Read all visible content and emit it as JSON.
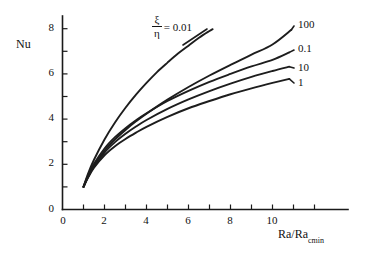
{
  "chart_data": {
    "type": "line",
    "title": "",
    "xlabel": "Ra/Ra",
    "xlabel_sub": "cmin",
    "ylabel": "Nu",
    "xlim": [
      0,
      12.6
    ],
    "ylim": [
      0,
      9.0
    ],
    "xticks": [
      0,
      1,
      2,
      3,
      4,
      5,
      6,
      7,
      8,
      9,
      10,
      11,
      12
    ],
    "xtick_labels": [
      "0",
      "",
      "2",
      "",
      "4",
      "",
      "6",
      "",
      "8",
      "",
      "10",
      "",
      ""
    ],
    "yticks": [
      0,
      1,
      2,
      3,
      4,
      5,
      6,
      7,
      8
    ],
    "ytick_labels": [
      "0",
      "",
      "2",
      "",
      "4",
      "",
      "6",
      "",
      "8"
    ],
    "grid": false,
    "legend_position": "inline-curve-end-labels",
    "parameter_symbol": "ξ/η",
    "parameter_numerator": "ξ",
    "parameter_denominator": "η",
    "annotation": "ξ/η = 0.01",
    "annotation_equals": "= 0.01",
    "series": [
      {
        "name": "0.01",
        "label": "0.01",
        "x": [
          1.0,
          1.2,
          1.5,
          2.0,
          2.5,
          3.0,
          3.5,
          4.0,
          4.5,
          5.0,
          5.5,
          6.0,
          6.5,
          7.0,
          7.15
        ],
        "y": [
          1.0,
          1.55,
          2.2,
          3.1,
          3.85,
          4.5,
          5.08,
          5.6,
          6.08,
          6.5,
          6.9,
          7.25,
          7.6,
          7.9,
          7.98
        ]
      },
      {
        "name": "100",
        "label": "100",
        "x": [
          1.0,
          1.2,
          1.5,
          2.0,
          2.5,
          3.0,
          3.5,
          4.0,
          5.0,
          6.0,
          7.0,
          8.0,
          9.0,
          10.0,
          10.9
        ],
        "y": [
          1.0,
          1.42,
          1.95,
          2.6,
          3.1,
          3.52,
          3.9,
          4.24,
          4.86,
          5.42,
          5.93,
          6.4,
          6.85,
          7.3,
          7.95
        ]
      },
      {
        "name": "0.1",
        "label": "0.1",
        "x": [
          1.0,
          1.2,
          1.5,
          2.0,
          2.5,
          3.0,
          3.5,
          4.0,
          5.0,
          6.0,
          7.0,
          8.0,
          9.0,
          10.0,
          10.8
        ],
        "y": [
          1.0,
          1.48,
          2.02,
          2.7,
          3.2,
          3.6,
          3.95,
          4.26,
          4.8,
          5.25,
          5.65,
          6.0,
          6.33,
          6.62,
          6.95
        ]
      },
      {
        "name": "10",
        "label": "10",
        "x": [
          1.0,
          1.2,
          1.5,
          2.0,
          2.5,
          3.0,
          3.5,
          4.0,
          5.0,
          6.0,
          7.0,
          8.0,
          9.0,
          10.0,
          10.8
        ],
        "y": [
          1.0,
          1.4,
          1.9,
          2.52,
          2.98,
          3.35,
          3.67,
          3.96,
          4.45,
          4.87,
          5.24,
          5.57,
          5.87,
          6.13,
          6.32
        ]
      },
      {
        "name": "1",
        "label": "1",
        "x": [
          1.0,
          1.2,
          1.5,
          2.0,
          2.5,
          3.0,
          3.5,
          4.0,
          5.0,
          6.0,
          7.0,
          8.0,
          9.0,
          10.0,
          10.8
        ],
        "y": [
          1.0,
          1.38,
          1.85,
          2.4,
          2.8,
          3.12,
          3.4,
          3.66,
          4.1,
          4.48,
          4.8,
          5.1,
          5.36,
          5.6,
          5.78
        ]
      }
    ]
  },
  "labels": {
    "y_axis_title": "Nu",
    "x_axis_title_main": "Ra/Ra",
    "x_axis_title_sub": "cmin",
    "curve_100": "100",
    "curve_01": "0.1",
    "curve_10": "10",
    "curve_1": "1",
    "param_num": "ξ",
    "param_den": "η",
    "param_value": "= 0.01",
    "tick_x_0": "0",
    "tick_x_2": "2",
    "tick_x_4": "4",
    "tick_x_6": "6",
    "tick_x_8": "8",
    "tick_x_10": "10",
    "tick_y_0": "0",
    "tick_y_2": "2",
    "tick_y_4": "4",
    "tick_y_6": "6",
    "tick_y_8": "8"
  },
  "colors": {
    "ink": "#1a1a1a",
    "background": "#ffffff"
  }
}
